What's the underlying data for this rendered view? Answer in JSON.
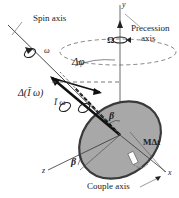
{
  "diagram": {
    "labels": {
      "spin_axis": "Spin axis",
      "precession_axis_line1": "Precession",
      "precession_axis_line2": "axis",
      "couple_axis": "Couple axis",
      "y_axis": "y",
      "x_axis": "x",
      "z_axis": "z",
      "omega_spin": "ω",
      "omega_precession": "Ω",
      "delta_phi": "Δφ",
      "delta_angular_momentum": "Δ(Ī ω)",
      "angular_momentum": "Ī ω",
      "beta_top": "β",
      "beta_bottom": "β",
      "moment_impulse": "MΔt",
      "figure_number": "..."
    },
    "colors": {
      "disk_fill": "#a8a8a8",
      "disk_edge": "#3a3a3a",
      "line": "#333333",
      "dashed": "#555555"
    }
  }
}
